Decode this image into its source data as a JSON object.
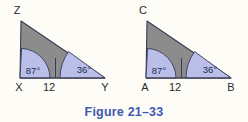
{
  "figure": {
    "caption": "Figure 21–33",
    "caption_color": "#4257b2",
    "background_color": "#fdfcf7",
    "triangle_fill": "#8c8c8c",
    "angle_fill": "#b9bfe8",
    "outline_color": "#3a3a55"
  },
  "triangles": [
    {
      "id": "left",
      "apex_label": "Z",
      "left_vertex_label": "X",
      "right_vertex_label": "Y",
      "base_segment_label": "12",
      "left_angle": "87°",
      "right_angle": "36°"
    },
    {
      "id": "right",
      "apex_label": "C",
      "left_vertex_label": "A",
      "right_vertex_label": "B",
      "base_segment_label": "12",
      "left_angle": "87°",
      "right_angle": "36°"
    }
  ]
}
